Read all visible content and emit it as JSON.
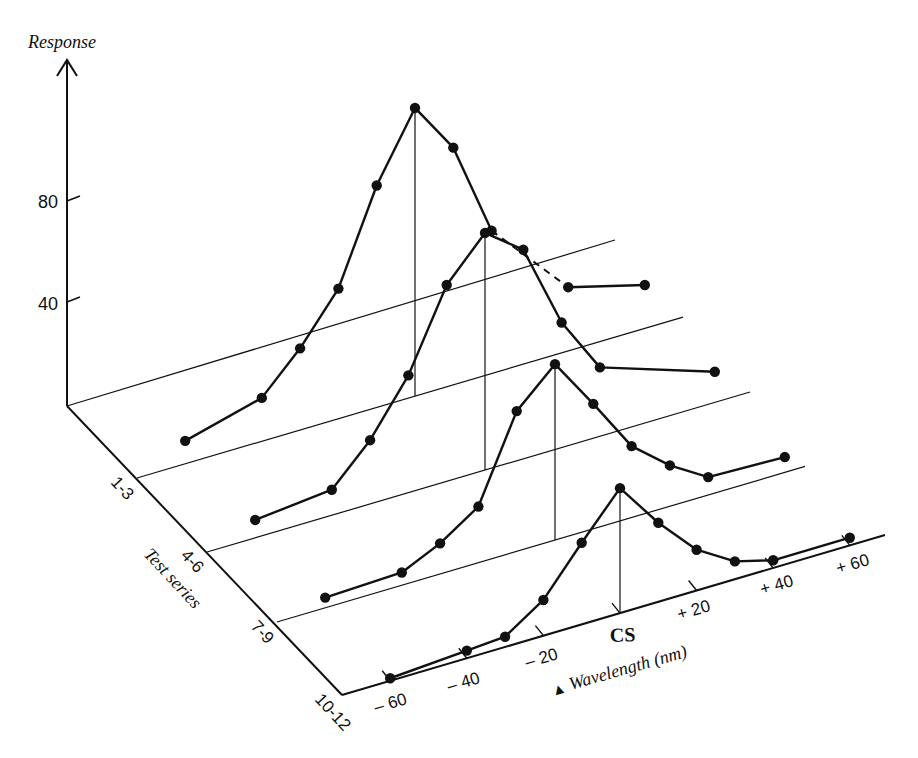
{
  "chart_data": {
    "type": "line",
    "subtype": "3d-waterfall",
    "title": "",
    "ylabel": "Response",
    "xlabel": "ΔWavelength (nm)",
    "zlabel": "Test series",
    "y_ticks": [
      40,
      80
    ],
    "x_tick_labels": [
      "– 60",
      "– 40",
      "– 20",
      "CS",
      "+ 20",
      "+ 40",
      "+ 60"
    ],
    "x_ticks": [
      -60,
      -40,
      -20,
      0,
      20,
      40,
      60
    ],
    "z_tick_labels": [
      "1-3",
      "4-6",
      "7-9",
      "10-12"
    ],
    "grid": false,
    "legend": null,
    "series": [
      {
        "name": "1-3",
        "x": [
          -60,
          -40,
          -30,
          -20,
          -10,
          0,
          10,
          20,
          40,
          60
        ],
        "values": [
          9,
          17,
          32,
          51,
          87,
          113,
          93,
          56,
          25,
          17
        ],
        "hidden_segment_dashed": [
          20,
          40
        ]
      },
      {
        "name": "4-6",
        "x": [
          -60,
          -40,
          -30,
          -20,
          -10,
          0,
          10,
          20,
          30,
          60
        ],
        "values": [
          7,
          10,
          25,
          46,
          77,
          93,
          82,
          49,
          27,
          12
        ]
      },
      {
        "name": "7-9",
        "x": [
          -60,
          -40,
          -30,
          -20,
          -10,
          0,
          10,
          20,
          30,
          40,
          60
        ],
        "values": [
          4,
          5,
          12,
          22,
          55,
          69,
          49,
          28,
          16,
          7,
          6
        ]
      },
      {
        "name": "10-12",
        "x": [
          -60,
          -40,
          -30,
          -20,
          -10,
          0,
          10,
          20,
          30,
          40,
          60
        ],
        "values": [
          1,
          3,
          4,
          14,
          32,
          49,
          31,
          16,
          7,
          3,
          3
        ]
      }
    ],
    "peak_markers": "vertical drop line from each series peak to its baseline"
  },
  "labels": {
    "response": "Response",
    "y80": "80",
    "y40": "40",
    "test_series": "Test series",
    "z1": "1-3",
    "z2": "4-6",
    "z3": "7-9",
    "z4": "10-12",
    "xm60": "– 60",
    "xm40": "– 40",
    "xm20": "– 20",
    "xcs": "CS",
    "xp20": "+ 20",
    "xp40": "+ 40",
    "xp60": "+ 60",
    "delta": "▲",
    "wavelength": "Wavelength (nm)"
  }
}
